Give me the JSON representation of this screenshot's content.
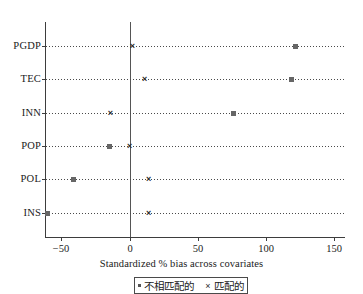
{
  "chart_data": {
    "type": "scatter",
    "title": "",
    "xlabel": "Standardized % bias across covariates",
    "ylabel": "",
    "orientation": "horizontal",
    "categories": [
      "PGDP",
      "TEC",
      "INN",
      "POP",
      "POL",
      "INS"
    ],
    "xlim": [
      -62,
      158
    ],
    "xticks": [
      -50,
      0,
      50,
      100,
      150
    ],
    "xticklabels": [
      "−50",
      "0",
      "50",
      "100",
      "150"
    ],
    "grid": "dotted-horizontal",
    "reference_line": 0,
    "legend_position": "below-axis-centered",
    "series": [
      {
        "name": "不相匹配的",
        "marker": "dot",
        "color": "#666666",
        "values": [
          122,
          119,
          76,
          -15,
          -41,
          -60
        ]
      },
      {
        "name": "匹配的",
        "marker": "cross",
        "color": "#2b2b2b",
        "values": [
          2,
          11,
          -14,
          0,
          14,
          14
        ]
      }
    ]
  },
  "axis": {
    "xlabel": "Standardized % bias across covariates"
  },
  "legend": {
    "entries": [
      {
        "label": "不相匹配的",
        "marker": "dot"
      },
      {
        "label": "匹配的",
        "marker": "cross"
      }
    ]
  }
}
